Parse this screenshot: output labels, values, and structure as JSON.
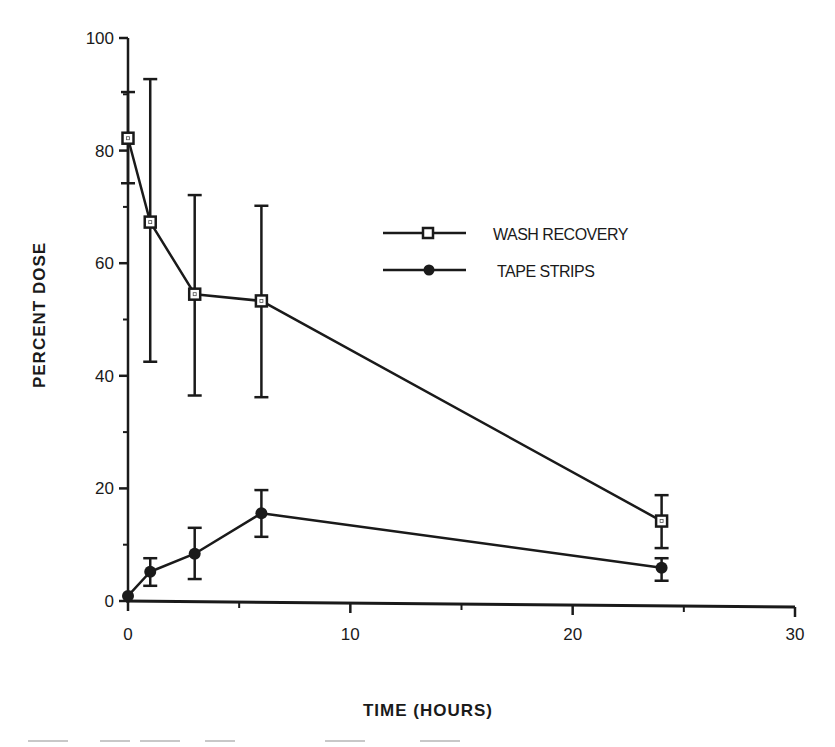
{
  "chart_data": {
    "type": "line",
    "title": "",
    "xlabel": "TIME (HOURS)",
    "ylabel": "PERCENT DOSE",
    "xlim": [
      0,
      30
    ],
    "ylim": [
      0,
      100
    ],
    "x_ticks": [
      0,
      10,
      20,
      30
    ],
    "x_minor_ticks": [
      5,
      15,
      25
    ],
    "y_ticks": [
      0,
      20,
      40,
      60,
      80,
      100
    ],
    "y_minor_ticks": [
      10,
      30,
      50,
      70,
      90
    ],
    "grid": false,
    "legend_position": "upper-right-inside",
    "x": [
      0,
      1,
      3,
      6,
      24
    ],
    "series": [
      {
        "name": "WASH RECOVERY",
        "marker": "open-square",
        "values": [
          82.2,
          67.3,
          54.5,
          53.3,
          14.2
        ],
        "error_upper": [
          90.4,
          92.7,
          72.1,
          70.2,
          18.8
        ],
        "error_lower": [
          74.2,
          42.5,
          36.5,
          36.2,
          9.4
        ]
      },
      {
        "name": "TAPE STRIPS",
        "marker": "filled-diamond",
        "values": [
          0.9,
          5.2,
          8.4,
          15.6,
          5.9
        ],
        "error_upper": [
          0.9,
          7.6,
          13.0,
          19.7,
          7.6
        ],
        "error_lower": [
          0.9,
          2.7,
          3.9,
          11.4,
          3.6
        ]
      }
    ]
  },
  "labels": {
    "ylabel": "PERCENT DOSE",
    "xlabel": "TIME (HOURS)",
    "legend": [
      "WASH RECOVERY",
      "TAPE STRIPS"
    ]
  }
}
